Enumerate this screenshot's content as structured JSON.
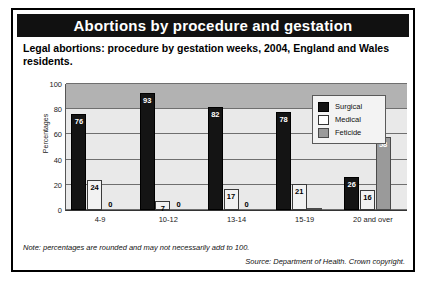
{
  "figure": {
    "title": "Abortions by procedure and gestation",
    "subtitle": "Legal abortions: procedure by gestation weeks, 2004, England and Wales residents.",
    "note": "Note: percentages are rounded and may not necessarily add to 100.",
    "source": "Source: Department of Health. Crown copyright.",
    "colors": {
      "title_bar_bg": "#111111",
      "title_text": "#ffffff",
      "surgical": "#141414",
      "medical": "#f2f2f2",
      "feticide": "#9a9a9a",
      "plot_bg": "#e9e9e9",
      "plot_band_bg": "#b2b2b2",
      "border": "#000000"
    }
  },
  "legend": {
    "position": "top-right-inside-plot",
    "entries": [
      {
        "label": "Surgical",
        "swatch": "surgical"
      },
      {
        "label": "Medical",
        "swatch": "medical"
      },
      {
        "label": "Feticide",
        "swatch": "feticide"
      }
    ]
  },
  "chart_data": {
    "type": "bar",
    "title": "Abortions by procedure and gestation",
    "subtitle": "Legal abortions: procedure by gestation weeks, 2004, England and Wales residents.",
    "xlabel": "",
    "ylabel": "Percentages",
    "ylim": [
      0,
      100
    ],
    "yticks": [
      0,
      20,
      40,
      60,
      80,
      100
    ],
    "ytick_labels": [
      "0",
      "20",
      "40",
      "60",
      "80",
      "100"
    ],
    "grid": true,
    "legend_position": "upper right",
    "categories": [
      "4-9",
      "10-12",
      "13-14",
      "15-19",
      "20 and over"
    ],
    "series": [
      {
        "name": "Surgical",
        "values": [
          76,
          93,
          82,
          78,
          26
        ]
      },
      {
        "name": "Medical",
        "values": [
          24,
          7,
          17,
          21,
          16
        ]
      },
      {
        "name": "Feticide",
        "values": [
          0,
          0,
          0,
          1,
          58
        ]
      }
    ]
  }
}
